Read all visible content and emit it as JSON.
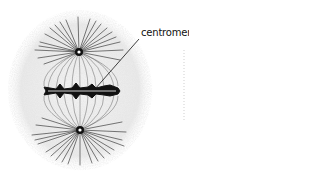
{
  "diagram": {
    "labels": [
      {
        "text": "centromere",
        "target": "centromere on metaphase plate"
      }
    ]
  },
  "colors": {
    "background": "#ffffff",
    "cytoplasm_stipple": "#d8d8d8",
    "ink": "#111111"
  }
}
